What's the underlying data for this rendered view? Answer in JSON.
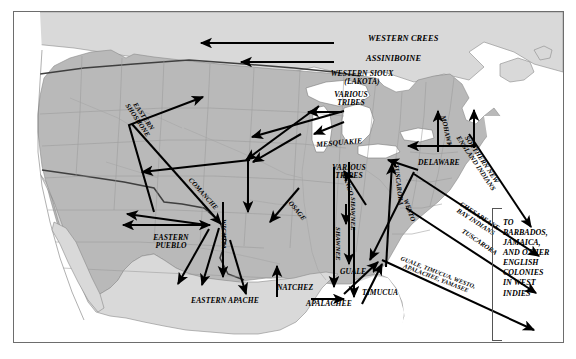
{
  "map": {
    "title": "Native American Forced Migrations and Indian Slave Trade Routes",
    "frame": {
      "border_color": "#6d6d6d",
      "background": "#ffffff"
    },
    "palette": {
      "united_states_land": "#b9b9b9",
      "foreign_land": "#d9d9d9",
      "water": "#ffffff",
      "state_border": "#8f8f8f",
      "national_border": "#4a4a4a",
      "coastline": "#777777",
      "arrow": "#000000",
      "label_text": "#000000"
    },
    "regions": [
      {
        "name": "united-states",
        "shade": "#b9b9b9"
      },
      {
        "name": "british-canada",
        "shade": "#d9d9d9"
      },
      {
        "name": "spanish-mexico",
        "shade": "#d9d9d9"
      },
      {
        "name": "spanish-florida",
        "shade": "#d9d9d9"
      }
    ]
  },
  "labels": {
    "western_crees": "WESTERN CREES",
    "assiniboine": "ASSINIBOINE",
    "western_sioux": "WESTERN SIOUX\n(LAKOTA)",
    "eastern_shoshone": "EASTERN\nSHOSHONE",
    "various_tribes_north": "VARIOUS\nTRIBES",
    "mesquakie": "MESQUAKIE",
    "various_tribes_midwest": "VARIOUS\nTRIBES",
    "comanche": "COMANCHE",
    "osage": "OSAGE",
    "wichita": "WICHITA",
    "eastern_pueblo": "EASTERN\nPUEBLO",
    "eastern_apache": "EASTERN APACHE",
    "natchez": "NATCHEZ",
    "shawnee_west": "SHAWNEE",
    "shawnee_east": "SHAWNEE",
    "mingo": "MINGO",
    "tuscarora_inland": "TUSCARORA",
    "mohawk": "MOHAWK",
    "delaware": "DELAWARE",
    "southern_new_england": "SOUTHERN NEW\nENGLAND INDIANS",
    "chesapeake_bay": "CHESAPEAKE\nBAY INDIANS",
    "tuscarora_coast": "TUSCARORA",
    "westo": "WESTO",
    "guale": "GUALE",
    "timucua": "TIMUCUA",
    "apalachee": "APALACHEE",
    "southeast_export": "GUALE, TIMUCUA, WESTO,\nAPALACHEE, YAMASEE",
    "west_indies_caption": "TO BARBADOS, JAMAICA, AND OTHER ENGLISH COLONIES IN WEST INDIES"
  },
  "west_indies_caption_lines": [
    "TO",
    "BARBADOS,",
    "JAMAICA,",
    "AND OTHER",
    "ENGLISH",
    "COLONIES",
    "IN WEST",
    "INDIES"
  ],
  "migration_routes": [
    {
      "group": "WESTERN CREES",
      "direction": "westward",
      "region": "northern-plains"
    },
    {
      "group": "ASSINIBOINE",
      "direction": "westward",
      "region": "northern-plains"
    },
    {
      "group": "WESTERN SIOUX (LAKOTA)",
      "direction": "west-and-southwest",
      "region": "northern-plains"
    },
    {
      "group": "EASTERN SHOSHONE",
      "direction": "northwestward",
      "region": "rocky-mountains"
    },
    {
      "group": "VARIOUS TRIBES",
      "direction": "southwestward",
      "region": "great-lakes"
    },
    {
      "group": "MESQUAKIE",
      "direction": "westward",
      "region": "upper-mississippi"
    },
    {
      "group": "COMANCHE",
      "direction": "southeastward",
      "region": "southern-plains"
    },
    {
      "group": "OSAGE",
      "direction": "southwestward",
      "region": "lower-missouri"
    },
    {
      "group": "WICHITA",
      "direction": "southward",
      "region": "southern-plains"
    },
    {
      "group": "EASTERN PUEBLO",
      "direction": "east-west",
      "region": "rio-grande"
    },
    {
      "group": "EASTERN APACHE",
      "direction": "southeastward",
      "region": "texas"
    },
    {
      "group": "NATCHEZ",
      "direction": "north-and-east",
      "region": "lower-mississippi"
    },
    {
      "group": "SHAWNEE",
      "direction": "southward",
      "region": "ohio-valley"
    },
    {
      "group": "MINGO",
      "direction": "southward",
      "region": "ohio-valley"
    },
    {
      "group": "TUSCARORA",
      "direction": "northward",
      "region": "carolina-to-iroquoia"
    },
    {
      "group": "MOHAWK",
      "direction": "northward",
      "region": "new-york"
    },
    {
      "group": "DELAWARE",
      "direction": "westward",
      "region": "mid-atlantic"
    },
    {
      "group": "SOUTHERN NEW ENGLAND INDIANS",
      "direction": "southeastward-overseas",
      "region": "new-england"
    },
    {
      "group": "CHESAPEAKE BAY INDIANS",
      "direction": "southeastward-overseas",
      "region": "chesapeake"
    },
    {
      "group": "TUSCARORA",
      "direction": "southeastward-overseas",
      "region": "carolina"
    },
    {
      "group": "WESTO",
      "direction": "southward",
      "region": "carolina"
    },
    {
      "group": "GUALE, TIMUCUA, WESTO, APALACHEE, YAMASEE",
      "direction": "southeastward-overseas",
      "region": "southeast"
    }
  ]
}
